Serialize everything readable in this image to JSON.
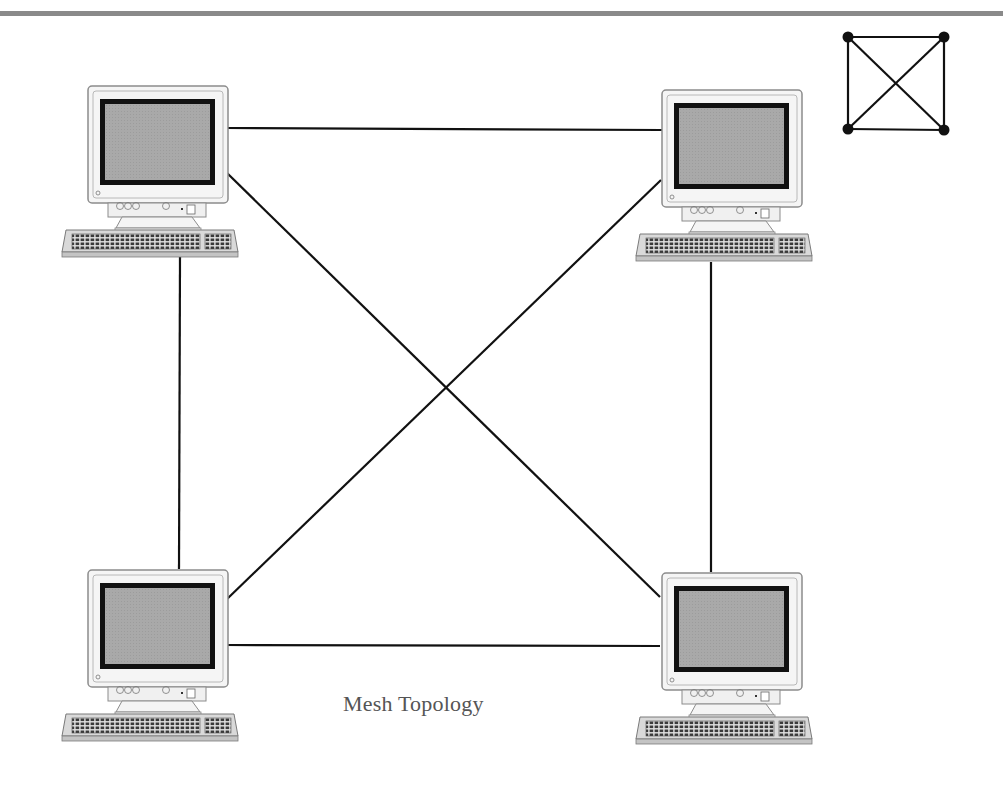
{
  "diagram": {
    "title": "Mesh Topology",
    "type": "network-topology",
    "topology": "mesh",
    "colors": {
      "background": "#ffffff",
      "top_rule": "#8a8a8a",
      "link": "#111111",
      "screen": "#a9a9a9",
      "screen_border": "#111111",
      "case": "#f4f4f4",
      "case_outline": "#8c8c8c",
      "caption": "#555555"
    },
    "nodes": [
      {
        "id": "computer-top-left",
        "label": "",
        "x": 60,
        "y": 86
      },
      {
        "id": "computer-top-right",
        "label": "",
        "x": 634,
        "y": 90
      },
      {
        "id": "computer-bottom-left",
        "label": "",
        "x": 60,
        "y": 570
      },
      {
        "id": "computer-bottom-right",
        "label": "",
        "x": 634,
        "y": 573
      }
    ],
    "links": [
      {
        "from": "computer-top-left",
        "to": "computer-top-right",
        "x1": 227,
        "y1": 128,
        "x2": 662,
        "y2": 130
      },
      {
        "from": "computer-bottom-left",
        "to": "computer-bottom-right",
        "x1": 226,
        "y1": 645,
        "x2": 660,
        "y2": 646
      },
      {
        "from": "computer-top-left",
        "to": "computer-bottom-left",
        "x1": 180,
        "y1": 257,
        "x2": 179,
        "y2": 569
      },
      {
        "from": "computer-top-right",
        "to": "computer-bottom-right",
        "x1": 711,
        "y1": 262,
        "x2": 711,
        "y2": 572
      },
      {
        "from": "computer-top-left",
        "to": "computer-bottom-right",
        "x1": 227,
        "y1": 173,
        "x2": 660,
        "y2": 597
      },
      {
        "from": "computer-top-right",
        "to": "computer-bottom-left",
        "x1": 661,
        "y1": 180,
        "x2": 226,
        "y2": 600
      }
    ],
    "legend_icon": {
      "name": "mesh-topology-icon",
      "nodes": 4,
      "edges": 6
    }
  }
}
